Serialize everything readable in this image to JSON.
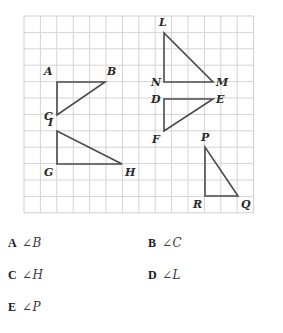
{
  "figure": {
    "grid": {
      "cols": 14,
      "rows": 12,
      "cell_px": 16.4,
      "origin_x": 24,
      "origin_y": 16,
      "line_color": "#d4d4d4",
      "border_color": "#cfcfcf"
    },
    "stroke_color": "#4a4a4a",
    "triangles": [
      {
        "name": "triangle-ABC",
        "vertices": [
          {
            "label": "A",
            "x": 57,
            "y": 82,
            "label_dx": -13,
            "label_dy": -16
          },
          {
            "label": "B",
            "x": 105,
            "y": 82,
            "label_dx": 2,
            "label_dy": -16
          },
          {
            "label": "C",
            "x": 57,
            "y": 115,
            "label_dx": -13,
            "label_dy": -4
          }
        ]
      },
      {
        "name": "triangle-GHI",
        "vertices": [
          {
            "label": "I",
            "x": 57,
            "y": 131,
            "label_dx": -9,
            "label_dy": -14
          },
          {
            "label": "G",
            "x": 57,
            "y": 164,
            "label_dx": -13,
            "label_dy": 3
          },
          {
            "label": "H",
            "x": 122,
            "y": 164,
            "label_dx": 3,
            "label_dy": 3
          }
        ]
      },
      {
        "name": "triangle-LNM",
        "vertices": [
          {
            "label": "L",
            "x": 164,
            "y": 33,
            "label_dx": -5,
            "label_dy": -16
          },
          {
            "label": "N",
            "x": 164,
            "y": 82,
            "label_dx": -13,
            "label_dy": -5
          },
          {
            "label": "M",
            "x": 213,
            "y": 82,
            "label_dx": 3,
            "label_dy": -5
          }
        ]
      },
      {
        "name": "triangle-DEF",
        "vertices": [
          {
            "label": "D",
            "x": 164,
            "y": 99,
            "label_dx": -13,
            "label_dy": -5
          },
          {
            "label": "E",
            "x": 213,
            "y": 99,
            "label_dx": 3,
            "label_dy": -5
          },
          {
            "label": "F",
            "x": 164,
            "y": 131,
            "label_dx": -12,
            "label_dy": 3
          }
        ]
      },
      {
        "name": "triangle-PQR",
        "vertices": [
          {
            "label": "P",
            "x": 205,
            "y": 147,
            "label_dx": -4,
            "label_dy": -15
          },
          {
            "label": "R",
            "x": 205,
            "y": 196,
            "label_dx": -12,
            "label_dy": 3
          },
          {
            "label": "Q",
            "x": 238,
            "y": 196,
            "label_dx": 3,
            "label_dy": 3
          }
        ]
      }
    ]
  },
  "choices": [
    {
      "letter": "A",
      "text": "∠B"
    },
    {
      "letter": "B",
      "text": "∠C"
    },
    {
      "letter": "C",
      "text": "∠H"
    },
    {
      "letter": "D",
      "text": "∠L"
    },
    {
      "letter": "E",
      "text": "∠P"
    }
  ]
}
